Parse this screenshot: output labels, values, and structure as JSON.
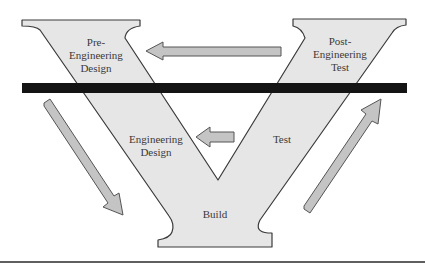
{
  "diagram": {
    "type": "v-model",
    "colors": {
      "v_fill": "#e6e6e6",
      "v_stroke": "#3a3a3a",
      "arrow_fill": "#c4c4c4",
      "arrow_stroke": "#555555",
      "bar": "#141414",
      "text": "#3a3a3a"
    },
    "phases": [
      {
        "id": "pre-engineering-design",
        "label": "Pre-\nEngineering\nDesign"
      },
      {
        "id": "post-engineering-test",
        "label": "Post-\nEngineering\nTest"
      },
      {
        "id": "engineering-design",
        "label": "Engineering\nDesign"
      },
      {
        "id": "test",
        "label": "Test"
      },
      {
        "id": "build",
        "label": "Build"
      }
    ],
    "arrows": [
      {
        "id": "arrow-post-to-pre",
        "direction": "left",
        "from": "Post-Engineering Test",
        "to": "Pre-Engineering Design"
      },
      {
        "id": "arrow-test-to-design",
        "direction": "left",
        "from": "Test",
        "to": "Engineering Design"
      },
      {
        "id": "arrow-descend",
        "direction": "down-right"
      },
      {
        "id": "arrow-ascend",
        "direction": "up-right"
      }
    ],
    "separator": {
      "id": "horizontal-divider"
    }
  }
}
